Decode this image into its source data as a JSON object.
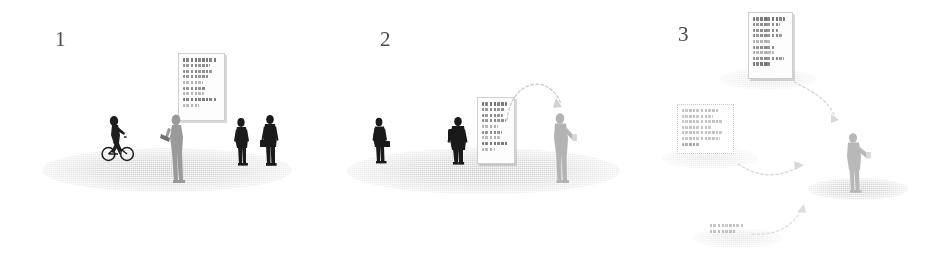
{
  "diagram": {
    "background_color": "#ffffff",
    "ink_dark": "#1a1a1a",
    "ink_mid": "#8c8c8c",
    "ink_light": "#c6c6c6",
    "ground_color": "#b4b4b4",
    "placard_fill": "#fdfdfd",
    "placard_border": "#cfcfcf"
  },
  "panels": [
    {
      "number": "1",
      "caption_visible": false,
      "ground": {
        "label": "ground-ellipse"
      },
      "placards": [
        {
          "id": "panel1-board",
          "name": "wall-notice-board",
          "style": "shadowed",
          "lines": [
            {
              "weight": "bold",
              "width": "94%"
            },
            {
              "weight": "normal",
              "width": "74%"
            },
            {
              "weight": "normal",
              "width": "80%"
            },
            {
              "weight": "normal",
              "width": "70%"
            },
            {
              "weight": "normal",
              "width": "54%"
            },
            {
              "weight": "normal",
              "width": "62%"
            },
            {
              "weight": "normal",
              "width": "58%"
            },
            {
              "weight": "bold",
              "width": "88%"
            },
            {
              "weight": "normal",
              "width": "44%"
            }
          ]
        }
      ],
      "figures": [
        {
          "name": "cyclist-figure",
          "tone": "dark"
        },
        {
          "name": "reading-figure-with-tablet",
          "tone": "mid"
        },
        {
          "name": "standing-figure-left",
          "tone": "dark"
        },
        {
          "name": "standing-figure-right",
          "tone": "dark"
        }
      ],
      "arrows": []
    },
    {
      "number": "2",
      "caption_visible": false,
      "ground": {
        "label": "ground-ellipse"
      },
      "placards": [
        {
          "id": "panel2-board",
          "name": "freestanding-notice-board",
          "style": "shadowed",
          "lines": [
            {
              "weight": "bold",
              "width": "90%"
            },
            {
              "weight": "normal",
              "width": "82%"
            },
            {
              "weight": "normal",
              "width": "76%"
            },
            {
              "weight": "normal",
              "width": "86%"
            },
            {
              "weight": "normal",
              "width": "58%"
            },
            {
              "weight": "normal",
              "width": "72%"
            },
            {
              "weight": "normal",
              "width": "64%"
            },
            {
              "weight": "bold",
              "width": "92%"
            },
            {
              "weight": "normal",
              "width": "46%"
            }
          ]
        }
      ],
      "figures": [
        {
          "name": "walking-figure-with-bag",
          "tone": "dark"
        },
        {
          "name": "standing-figure-with-backpack",
          "tone": "dark"
        },
        {
          "name": "phone-user-figure",
          "tone": "light"
        }
      ],
      "arrows": [
        {
          "name": "board-to-phone-arc-arrow",
          "style": "dotted-arc"
        }
      ]
    },
    {
      "number": "3",
      "caption_visible": false,
      "ground": {
        "label": "multiple-floating-ground-ellipses"
      },
      "placards": [
        {
          "id": "panel3-board-top",
          "name": "floating-board-top",
          "style": "shadowed",
          "lines": [
            {
              "weight": "bold",
              "width": "92%"
            },
            {
              "weight": "normal",
              "width": "78%"
            },
            {
              "weight": "normal",
              "width": "70%"
            },
            {
              "weight": "normal",
              "width": "84%"
            },
            {
              "weight": "normal",
              "width": "52%"
            },
            {
              "weight": "normal",
              "width": "66%"
            },
            {
              "weight": "normal",
              "width": "60%"
            },
            {
              "weight": "normal",
              "width": "88%"
            },
            {
              "weight": "bold",
              "width": "48%"
            }
          ]
        },
        {
          "id": "panel3-board-left",
          "name": "floating-board-left",
          "style": "ghost",
          "lines": [
            {
              "weight": "normal",
              "width": "78%"
            },
            {
              "weight": "normal",
              "width": "66%"
            },
            {
              "weight": "normal",
              "width": "90%"
            },
            {
              "weight": "normal",
              "width": "62%"
            },
            {
              "weight": "normal",
              "width": "86%"
            },
            {
              "weight": "normal",
              "width": "80%"
            },
            {
              "weight": "bold",
              "width": "40%"
            }
          ]
        },
        {
          "id": "panel3-board-bottom",
          "name": "floating-board-bottom",
          "style": "ghost",
          "lines": [
            {
              "weight": "normal",
              "width": "84%"
            },
            {
              "weight": "normal",
              "width": "66%"
            }
          ]
        }
      ],
      "figures": [
        {
          "name": "phone-user-figure",
          "tone": "light"
        }
      ],
      "arrows": [
        {
          "name": "top-board-to-figure-arrow",
          "style": "dotted-arc"
        },
        {
          "name": "left-board-to-figure-arrow",
          "style": "dotted-arc"
        },
        {
          "name": "bottom-board-to-figure-arrow",
          "style": "dotted-arc"
        }
      ]
    }
  ]
}
